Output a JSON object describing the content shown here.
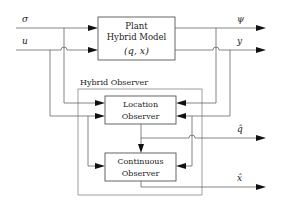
{
  "diagram": {
    "blocks": {
      "plant": {
        "line1": "Plant",
        "line2": "Hybrid Model",
        "line3": "(q, x)"
      },
      "hybrid_observer": {
        "label": "Hybrid Observer"
      },
      "location_observer": {
        "line1": "Location",
        "line2": "Observer"
      },
      "continuous_observer": {
        "line1": "Continuous",
        "line2": "Observer"
      }
    },
    "signals": {
      "sigma": "σ",
      "u": "u",
      "psi": "ψ",
      "y": "y",
      "q_hat": "q̂",
      "x_hat": "x̂"
    },
    "colors": {
      "line": "#666666",
      "arrow": "#111111",
      "box": "#555555",
      "text": "#222222"
    }
  }
}
